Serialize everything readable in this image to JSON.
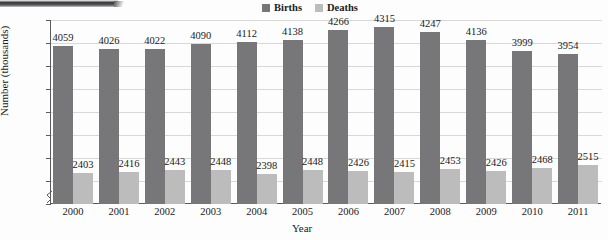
{
  "chart_data": {
    "type": "bar",
    "title": "",
    "xlabel": "Year",
    "ylabel": "Number (thousands)",
    "ylim": [
      2000,
      4400
    ],
    "ytick_step": 300,
    "yticks": [
      2000,
      2300,
      2600,
      2900,
      3200,
      3500,
      3800,
      4100,
      4400
    ],
    "grid": true,
    "axis_break": true,
    "legend_position": "top-center",
    "categories": [
      "2000",
      "2001",
      "2002",
      "2003",
      "2004",
      "2005",
      "2006",
      "2007",
      "2008",
      "2009",
      "2010",
      "2011"
    ],
    "series": [
      {
        "name": "Births",
        "color": "#77777a",
        "values": [
          4059,
          4026,
          4022,
          4090,
          4112,
          4138,
          4266,
          4315,
          4247,
          4136,
          3999,
          3954
        ]
      },
      {
        "name": "Deaths",
        "color": "#bcbcbc",
        "values": [
          2403,
          2416,
          2443,
          2448,
          2398,
          2448,
          2426,
          2415,
          2453,
          2426,
          2468,
          2515
        ]
      }
    ]
  },
  "legend": {
    "items": [
      {
        "label": "Births",
        "color": "#77777a"
      },
      {
        "label": "Deaths",
        "color": "#bcbcbc"
      }
    ]
  },
  "axes": {
    "y_title": "Number (thousands)",
    "x_title": "Year"
  }
}
